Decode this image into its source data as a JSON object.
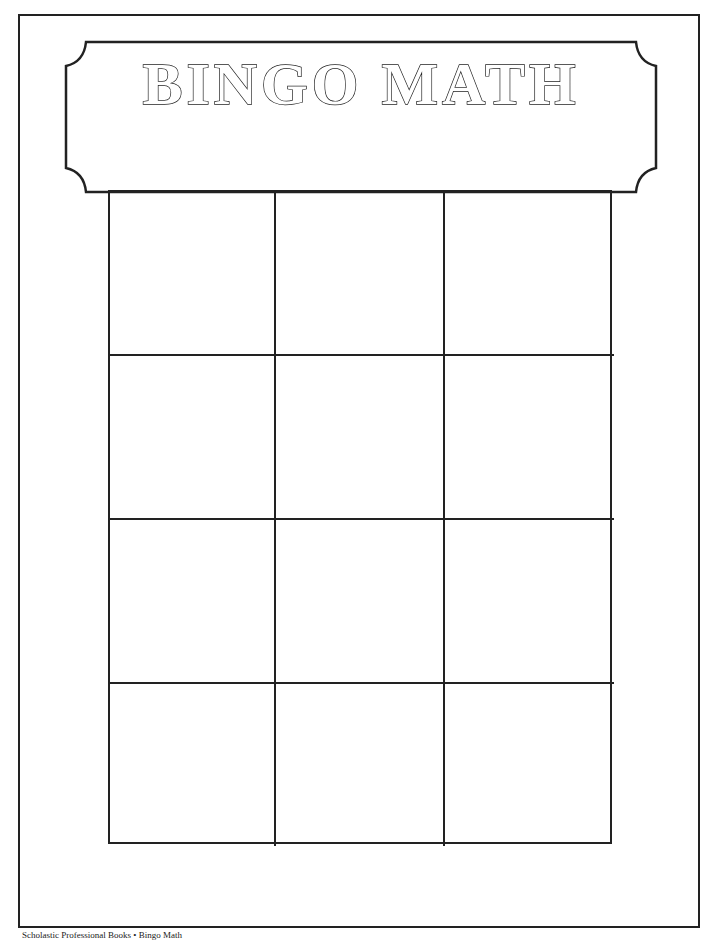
{
  "banner": {
    "title": "BINGO MATH"
  },
  "grid": {
    "rows": 4,
    "columns": 3,
    "cells": [
      [
        "",
        "",
        ""
      ],
      [
        "",
        "",
        ""
      ],
      [
        "",
        "",
        ""
      ],
      [
        "",
        "",
        ""
      ]
    ]
  },
  "footer": {
    "text": "Scholastic Professional Books • Bingo Math"
  },
  "colors": {
    "line": "#222222",
    "background": "#ffffff"
  }
}
